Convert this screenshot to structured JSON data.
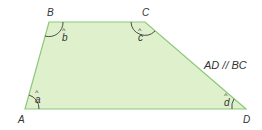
{
  "diagram": {
    "type": "trapezoid",
    "fill_color": "#dff0cc",
    "stroke_color": "#8cc97a",
    "vertices": {
      "A": {
        "label": "A",
        "x": 25,
        "y": 109
      },
      "B": {
        "label": "B",
        "x": 49,
        "y": 22
      },
      "C": {
        "label": "C",
        "x": 145,
        "y": 22
      },
      "D": {
        "label": "D",
        "x": 246,
        "y": 109
      }
    },
    "angles": {
      "a": {
        "label": "a",
        "hat": "^"
      },
      "b": {
        "label": "b",
        "hat": "^"
      },
      "c": {
        "label": "c",
        "hat": "^"
      },
      "d": {
        "label": "d",
        "hat": "^"
      }
    },
    "annotation": "AD // BC"
  }
}
